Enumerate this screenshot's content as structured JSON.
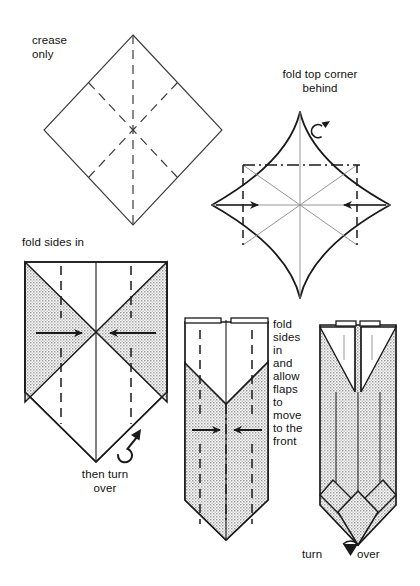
{
  "page": {
    "background_color": "#ffffff",
    "ink_color": "#1a1a1a",
    "shading_color": "#d8d8d8",
    "width": 420,
    "height": 586
  },
  "captions": {
    "crease_only": "crease\nonly",
    "fold_top_corner_behind": "fold top corner\nbehind",
    "fold_sides_in": "fold sides in",
    "then_turn_over": "then turn\nover",
    "fold_sides_in_allow_flaps": "fold\nsides\nin\nand\nallow\nflaps\nto\nmove\nto the\nfront",
    "turn_label": "turn",
    "over_label": "over"
  },
  "steps": [
    {
      "index": 1,
      "name": "crease-only-diamond",
      "caption": "crease\nonly",
      "shape": "square rotated 45 degrees (diamond)",
      "line_styles": [
        "solid outline",
        "dashed vertical crease",
        "dashed diagonal creases"
      ],
      "shaded": false,
      "symbols": []
    },
    {
      "index": 2,
      "name": "fold-top-corner-behind",
      "caption": "fold top corner\nbehind",
      "shape": "diamond with concave curved sides",
      "line_styles": [
        "solid curved outline",
        "dash-dot horizontal fold line",
        "dashed vertical side creases",
        "thin solid diagonals"
      ],
      "shaded": false,
      "symbols": [
        "fold-behind-arrow",
        "arrow-right",
        "arrow-left"
      ]
    },
    {
      "index": 3,
      "name": "fold-sides-in-diamond",
      "caption": "fold sides in",
      "sub_caption": "then turn\nover",
      "shape": "diamond with two shaded side triangles",
      "line_styles": [
        "solid outline",
        "dashed vertical creases",
        "solid center line"
      ],
      "shaded": true,
      "symbols": [
        "arrow-right",
        "arrow-left",
        "turn-over-loop-arrow"
      ]
    },
    {
      "index": 4,
      "name": "fold-sides-in-allow-flaps",
      "caption": "fold\nsides\nin\nand\nallow\nflaps\nto\nmove\nto the\nfront",
      "shape": "tall rectangle with pointed bottom and V notch",
      "line_styles": [
        "solid outline",
        "dashed vertical creases",
        "dash-dot center line"
      ],
      "shaded": true,
      "symbols": [
        "arrow-right",
        "arrow-left"
      ]
    },
    {
      "index": 5,
      "name": "turn-over-result",
      "caption": "turn  over",
      "shape": "narrow tall form with folded flaps and pointed base",
      "line_styles": [
        "solid outline",
        "thin interior fold lines"
      ],
      "shaded": true,
      "symbols": [
        "turn-over-arrow"
      ]
    }
  ],
  "colors": {
    "ink": "#1a1a1a",
    "paper": "#ffffff",
    "shade": "#d9d9d9",
    "shade_dot": "#9a9a9a"
  }
}
